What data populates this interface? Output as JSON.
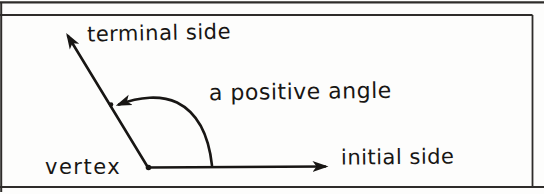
{
  "figure": {
    "labels": {
      "terminal_side": "terminal side",
      "positive_angle": "a positive angle",
      "vertex": "vertex",
      "initial_side": "initial side"
    }
  },
  "colors": {
    "ink": "#181614",
    "frame": "#2e2c2a",
    "paper": "#fdfdfc"
  }
}
